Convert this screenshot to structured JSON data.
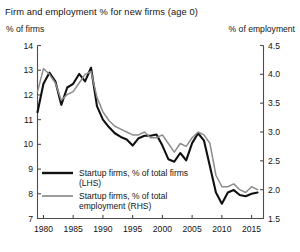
{
  "chart_data": {
    "type": "line",
    "title": "Firm and employment % for new firms (age 0)",
    "xlabel": "",
    "ylabel": "% of firms",
    "ylabel_right": "% of employment",
    "ylim": [
      7,
      14
    ],
    "ylim_right": [
      1.5,
      4.5
    ],
    "xlim": [
      1979,
      2017
    ],
    "grid": false,
    "legend_position": "lower-left-inside",
    "yticks": [
      7,
      8,
      9,
      10,
      11,
      12,
      13,
      14
    ],
    "ytick_labels": [
      "7",
      "8",
      "9",
      "10",
      "11",
      "12",
      "13",
      "14"
    ],
    "yticks_right": [
      1.5,
      2.0,
      2.5,
      3.0,
      3.5,
      4.0,
      4.5
    ],
    "ytick_labels_right": [
      "1.5",
      "2.0",
      "2.5",
      "3.0",
      "3.5",
      "4.0",
      "4.5"
    ],
    "xticks": [
      1980,
      1985,
      1990,
      1995,
      2000,
      2005,
      2010,
      2015
    ],
    "xtick_labels": [
      "1980",
      "1985",
      "1990",
      "1995",
      "2000",
      "2005",
      "2010",
      "2015"
    ],
    "x": [
      1979,
      1980,
      1981,
      1982,
      1983,
      1984,
      1985,
      1986,
      1987,
      1988,
      1989,
      1990,
      1991,
      1992,
      1993,
      1994,
      1995,
      1996,
      1997,
      1998,
      1999,
      2000,
      2001,
      2002,
      2003,
      2004,
      2005,
      2006,
      2007,
      2008,
      2009,
      2010,
      2011,
      2012,
      2013,
      2014,
      2015,
      2016
    ],
    "series": [
      {
        "name": "Startup firms, % of total firms (LHS)",
        "axis": "left",
        "color": "#111111",
        "values": [
          11.3,
          12.45,
          12.9,
          12.55,
          11.6,
          12.3,
          12.45,
          12.85,
          12.55,
          13.1,
          11.55,
          11.0,
          10.7,
          10.45,
          10.3,
          10.2,
          9.95,
          10.25,
          10.35,
          10.35,
          10.4,
          9.95,
          9.4,
          9.3,
          9.65,
          9.35,
          10.05,
          10.45,
          10.15,
          9.1,
          8.05,
          7.6,
          8.05,
          8.15,
          7.95,
          7.9,
          8.0,
          8.05
        ]
      },
      {
        "name": "Startup firms, % of total employment (RHS)",
        "axis": "right",
        "color": "#8c8c8c",
        "values": [
          3.7,
          4.1,
          4.0,
          3.85,
          3.55,
          3.65,
          3.7,
          3.85,
          4.0,
          4.05,
          3.6,
          3.35,
          3.2,
          3.1,
          3.05,
          3.0,
          2.95,
          2.95,
          3.0,
          2.9,
          2.9,
          2.95,
          2.8,
          2.65,
          2.8,
          2.75,
          2.9,
          3.0,
          2.95,
          2.8,
          2.25,
          2.05,
          2.05,
          2.1,
          2.0,
          1.95,
          2.05,
          2.0
        ]
      }
    ],
    "legend": [
      {
        "label_line1": "Startup firms, % of total firms",
        "label_line2": "(LHS)",
        "color": "#111111"
      },
      {
        "label_line1": "Startup firms, % of total",
        "label_line2": "employment (RHS)",
        "color": "#8c8c8c"
      }
    ]
  }
}
